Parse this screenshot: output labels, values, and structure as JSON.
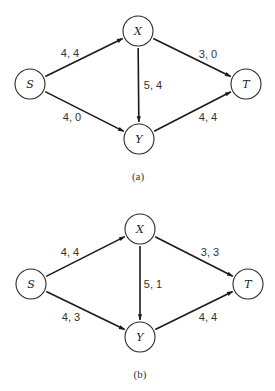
{
  "diagrams": [
    {
      "caption": "(a)",
      "nodes": {
        "S": {
          "label": "S",
          "x": 30,
          "y": 84
        },
        "X": {
          "label": "X",
          "x": 138,
          "y": 31
        },
        "Y": {
          "label": "Y",
          "x": 139,
          "y": 139
        },
        "T": {
          "label": "T",
          "x": 246,
          "y": 84
        }
      },
      "edges": [
        {
          "from": "S",
          "to": "X",
          "label": "4, 4",
          "lx": 70,
          "ly": 53
        },
        {
          "from": "S",
          "to": "Y",
          "label": "4, 0",
          "lx": 72,
          "ly": 117
        },
        {
          "from": "X",
          "to": "Y",
          "label": "5, 4",
          "lx": 153,
          "ly": 85
        },
        {
          "from": "X",
          "to": "T",
          "label": "3, 0",
          "lx": 208,
          "ly": 54
        },
        {
          "from": "Y",
          "to": "T",
          "label": "4, 4",
          "lx": 208,
          "ly": 117
        }
      ],
      "caption_pos": {
        "x": 138,
        "y": 176
      }
    },
    {
      "caption": "(b)",
      "nodes": {
        "S": {
          "label": "S",
          "x": 31,
          "y": 284
        },
        "X": {
          "label": "X",
          "x": 140,
          "y": 229
        },
        "Y": {
          "label": "Y",
          "x": 140,
          "y": 337
        },
        "T": {
          "label": "T",
          "x": 248,
          "y": 284
        }
      },
      "edges": [
        {
          "from": "S",
          "to": "X",
          "label": "4, 4",
          "lx": 70,
          "ly": 252
        },
        {
          "from": "S",
          "to": "Y",
          "label": "4, 3",
          "lx": 71,
          "ly": 317
        },
        {
          "from": "X",
          "to": "Y",
          "label": "5, 1",
          "lx": 153,
          "ly": 284
        },
        {
          "from": "X",
          "to": "T",
          "label": "3, 3",
          "lx": 210,
          "ly": 252
        },
        {
          "from": "Y",
          "to": "T",
          "label": "4, 4",
          "lx": 208,
          "ly": 317
        }
      ],
      "caption_pos": {
        "x": 140,
        "y": 374
      }
    }
  ],
  "style": {
    "node_radius": 15,
    "stroke_color": "#1a1a1a",
    "background": "#ffffff"
  }
}
